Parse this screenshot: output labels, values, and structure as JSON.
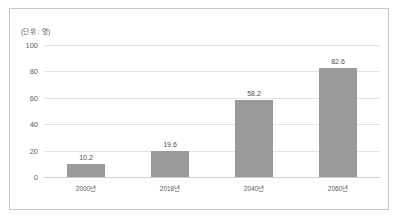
{
  "chart_data": {
    "type": "bar",
    "title": "",
    "subtitle": "",
    "unit_label": "(단위 : 명)",
    "categories": [
      "2000년",
      "2018년",
      "2040년",
      "2060년"
    ],
    "values": [
      10.2,
      19.6,
      58.2,
      82.6
    ],
    "value_labels": [
      "10.2",
      "19.6",
      "58.2",
      "82.6"
    ],
    "xlabel": "",
    "ylabel": "",
    "ylim": [
      0,
      100
    ],
    "yticks": [
      0,
      20,
      40,
      60,
      80,
      100
    ],
    "ytick_labels": [
      "0",
      "20",
      "40",
      "60",
      "80",
      "100"
    ],
    "grid": true,
    "legend": false,
    "series": [
      {
        "name": "",
        "color": "#9a9a9a",
        "values": [
          10.2,
          19.6,
          58.2,
          82.6
        ]
      }
    ]
  },
  "style": {
    "bar_color": "#9a9a9a",
    "grid_color": "#e2e2e2",
    "axis_color": "#cfcfcf",
    "frame_color": "#c8c8c8",
    "text_color": "#5a5a5a",
    "background": "#ffffff"
  }
}
